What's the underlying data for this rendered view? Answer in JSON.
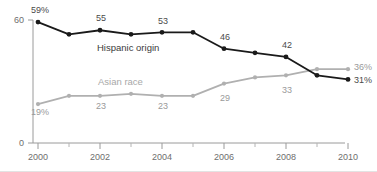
{
  "chart_data": {
    "type": "line",
    "title": "",
    "xlabel": "",
    "ylabel": "",
    "x": [
      2000,
      2001,
      2002,
      2003,
      2004,
      2005,
      2006,
      2007,
      2008,
      2009,
      2010
    ],
    "xtick_labels": [
      "2000",
      "2002",
      "2004",
      "2006",
      "2008",
      "2010"
    ],
    "xticks": [
      2000,
      2002,
      2004,
      2006,
      2008,
      2010
    ],
    "ytick_labels": [
      "0",
      "60"
    ],
    "yticks": [
      0,
      60
    ],
    "ylim": [
      0,
      60
    ],
    "xlim": [
      2000,
      2010
    ],
    "grid": false,
    "legend_position": "inline-annotation",
    "series": [
      {
        "name": "Hispanic origin",
        "color": "#1a1a1a",
        "values": [
          59,
          53,
          55,
          53,
          54,
          54,
          46,
          44,
          42,
          33,
          31
        ],
        "point_labels": [
          {
            "x": 2000,
            "text": "59%",
            "position": "above"
          },
          {
            "x": 2002,
            "text": "55",
            "position": "above"
          },
          {
            "x": 2004,
            "text": "53",
            "position": "above"
          },
          {
            "x": 2006,
            "text": "46",
            "position": "above"
          },
          {
            "x": 2008,
            "text": "42",
            "position": "above"
          },
          {
            "x": 2010,
            "text": "31%",
            "position": "right"
          }
        ]
      },
      {
        "name": "Asian race",
        "color": "#b0b0b0",
        "values": [
          19,
          23,
          23,
          24,
          23,
          23,
          29,
          32,
          33,
          36,
          36
        ],
        "point_labels": [
          {
            "x": 2000,
            "text": "19%",
            "position": "below"
          },
          {
            "x": 2002,
            "text": "23",
            "position": "below"
          },
          {
            "x": 2004,
            "text": "23",
            "position": "below"
          },
          {
            "x": 2006,
            "text": "29",
            "position": "below"
          },
          {
            "x": 2008,
            "text": "33",
            "position": "below"
          },
          {
            "x": 2010,
            "text": "36%",
            "position": "right"
          }
        ]
      }
    ]
  },
  "labels": {
    "y_top": "60",
    "y_bottom": "0",
    "x_2000": "2000",
    "x_2002": "2002",
    "x_2004": "2004",
    "x_2006": "2006",
    "x_2008": "2008",
    "x_2010": "2010",
    "series_hispanic": "Hispanic origin",
    "series_asian": "Asian race",
    "d_black_2000": "59%",
    "d_black_2002": "55",
    "d_black_2004": "53",
    "d_black_2006": "46",
    "d_black_2008": "42",
    "d_black_2010": "31%",
    "d_gray_2000": "19%",
    "d_gray_2002": "23",
    "d_gray_2004": "23",
    "d_gray_2006": "29",
    "d_gray_2008": "33",
    "d_gray_2010": "36%"
  },
  "colors": {
    "hispanic": "#1a1a1a",
    "asian": "#b0b0b0",
    "axis": "#9a9a9a",
    "tick_text": "#6e6e6e"
  }
}
